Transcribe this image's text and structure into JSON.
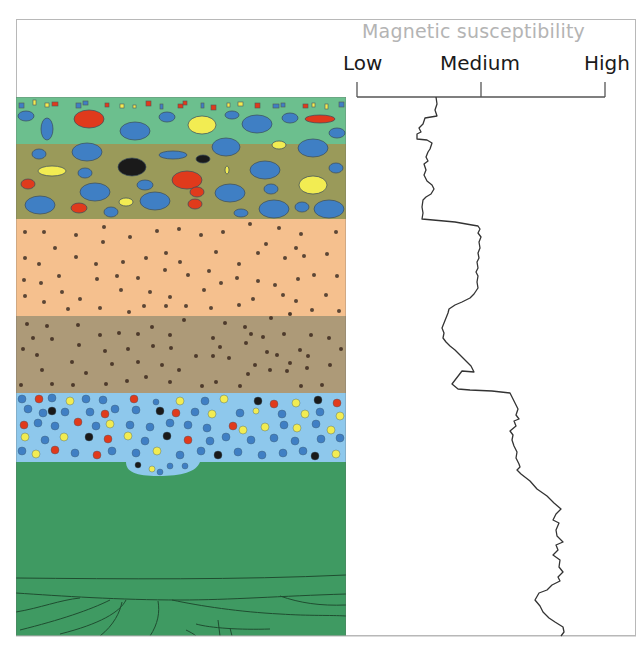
{
  "diagram": {
    "axis": {
      "title": "Magnetic susceptibility",
      "ticks": [
        {
          "label": "Low",
          "x": 357
        },
        {
          "label": "Medium",
          "x": 481
        },
        {
          "label": "High",
          "x": 605
        }
      ]
    },
    "strata": [
      {
        "name": "top-soil-clasts",
        "top": 97,
        "bottom": 144,
        "color": "#6cbf8e",
        "texture": "mixed clasts and small squares"
      },
      {
        "name": "olive-clast-layer",
        "top": 144,
        "bottom": 219,
        "color": "#9a9a5a",
        "texture": "large blue, red, yellow, black clasts"
      },
      {
        "name": "peach-sand",
        "top": 219,
        "bottom": 316,
        "color": "#f5c08e",
        "texture": "dark dots"
      },
      {
        "name": "taupe-silt",
        "top": 316,
        "bottom": 393,
        "color": "#ad9a78",
        "texture": "dark dots"
      },
      {
        "name": "blue-gravel",
        "top": 393,
        "bottom": 462,
        "color": "#8ec8ec",
        "texture": "dense mixed pebbles"
      },
      {
        "name": "green-bedrock",
        "top": 462,
        "bottom": 636,
        "color": "#3f9a62",
        "texture": "bedding lines at base"
      }
    ],
    "colors": {
      "clast_blue": "#3f7fc4",
      "clast_red": "#e03a1c",
      "clast_yellow": "#f2ec52",
      "clast_black": "#1a1a1a",
      "dot": "#5b4636",
      "curve": "#333333",
      "axis_line": "#555555",
      "title": "#b4b4b4"
    },
    "curve_points": "436,97 437,104 435,110 437,116 425,118 423,124 419,128 421,132 417,134 417,139 427,140 432,143 430,149 428,152 426,157 428,161 424,164 426,170 424,175 427,181 432,185 434,189 431,194 426,197 423,200 422,207 423,213 422,219 433,220 455,222 472,225 478,226 480,229 478,233 481,237 479,242 480,248 478,253 479,258 477,262 478,268 476,272 478,276 477,282 478,288 474,294 470,298 462,302 455,305 449,309 448,313 446,318 444,323 442,328 444,333 443,338 446,342 450,346 455,350 459,354 463,358 467,362 471,366 474,372 462,371 452,384 458,389 470,390 492,391 510,393 512,397 515,403 518,409 516,415 519,419 514,421 516,426 510,431 513,435 512,440 514,446 517,452 516,458 519,464 520,467 517,470 521,474 530,481 537,489 547,496 554,503 561,509 556,514 553,520 559,523 556,530 557,536 563,542 556,545 558,550 553,555 560,560 559,567 563,572 558,577 560,581 552,585 547,590 539,593 535,600 540,606 543,612 549,618 555,622 563,627 564,632 561,636"
  },
  "caption": ""
}
